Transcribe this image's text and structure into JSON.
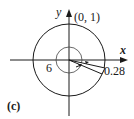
{
  "diagram": {
    "panel_label": "(c)",
    "axis_x_label": "x",
    "axis_y_label": "y",
    "point_label": "(0, 1)",
    "inner_label": "6",
    "wedge_label": "0.28",
    "colors": {
      "stroke": "#1a1a1a",
      "background": "#ffffff"
    }
  }
}
